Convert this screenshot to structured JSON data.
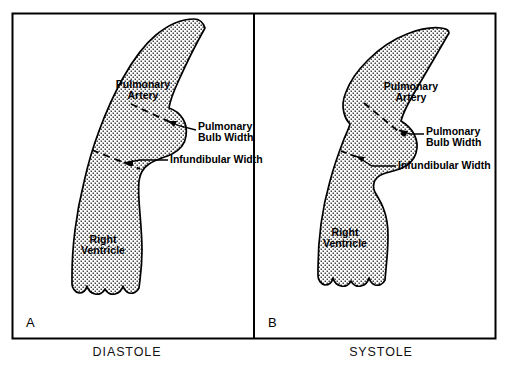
{
  "figure": {
    "type": "anatomical-diagram",
    "panels": [
      {
        "id": "A",
        "panel_letter": "A",
        "caption": "DIASTOLE",
        "labels": [
          {
            "key": "pulmonary_artery",
            "line1": "Pulmonary",
            "line2": "Artery"
          },
          {
            "key": "pulmonary_bulb_width",
            "line1": "Pulmonary",
            "line2": "Bulb Width"
          },
          {
            "key": "infundibular_width",
            "line1": "Infundibular Width",
            "line2": ""
          },
          {
            "key": "right_ventricle",
            "line1": "Right",
            "line2": "Ventricle"
          }
        ]
      },
      {
        "id": "B",
        "panel_letter": "B",
        "caption": "SYSTOLE",
        "labels": [
          {
            "key": "pulmonary_artery",
            "line1": "Pulmonary",
            "line2": "Artery"
          },
          {
            "key": "pulmonary_bulb_width",
            "line1": "Pulmonary",
            "line2": "Bulb Width"
          },
          {
            "key": "infundibular_width",
            "line1": "Infundibular Width",
            "line2": ""
          },
          {
            "key": "right_ventricle",
            "line1": "Right",
            "line2": "Ventricle"
          }
        ]
      }
    ],
    "colors": {
      "ink": "#000000",
      "background": "#ffffff",
      "stipple": "#1a1a1a"
    }
  }
}
